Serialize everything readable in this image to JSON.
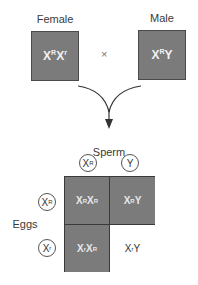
{
  "parents": {
    "female": {
      "label": "Female",
      "genotype": {
        "a": "X",
        "a_sup": "R",
        "b": "X",
        "b_sup": "r"
      }
    },
    "male": {
      "label": "Male",
      "genotype": {
        "a": "X",
        "a_sup": "R",
        "b": "Y",
        "b_sup": ""
      }
    },
    "cross_symbol": "×"
  },
  "sperm": {
    "label": "Sperm",
    "gametes": [
      {
        "base": "X",
        "sup": "R"
      },
      {
        "base": "Y",
        "sup": ""
      }
    ]
  },
  "eggs": {
    "label": "Eggs",
    "gametes": [
      {
        "base": "X",
        "sup": "R"
      },
      {
        "base": "X",
        "sup": "r"
      }
    ]
  },
  "punnett": {
    "cells": [
      {
        "a": "X",
        "a_sup": "R",
        "b": "X",
        "b_sup": "R",
        "shaded": true
      },
      {
        "a": "X",
        "a_sup": "R",
        "b": "Y",
        "b_sup": "",
        "shaded": true
      },
      {
        "a": "X",
        "a_sup": "r",
        "b": "X",
        "b_sup": "R",
        "shaded": true
      },
      {
        "a": "X",
        "a_sup": "r",
        "b": "Y",
        "b_sup": "",
        "shaded": false
      }
    ]
  },
  "colors": {
    "shaded_fill": "#7b7b7b",
    "border": "#3a3a3a",
    "unshaded_fill": "#ffffff"
  }
}
